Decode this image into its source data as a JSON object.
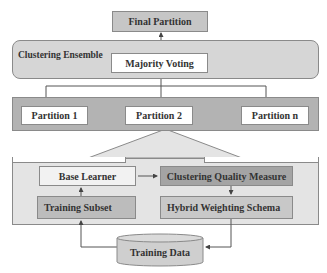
{
  "diagram": {
    "final_partition": "Final Partition",
    "ensemble": {
      "label": "Clustering Ensemble",
      "majority_voting": "Majority Voting"
    },
    "partitions": [
      "Partition 1",
      "Partition 2",
      "Partition n"
    ],
    "learning": {
      "base_learner": "Base Learner",
      "training_subset": "Training Subset",
      "quality_measure": "Clustering Quality Measure",
      "weighting_schema": "Hybrid Weighting Schema"
    },
    "training_data": "Training Data",
    "colors": {
      "final_partition": "#c6c6c6",
      "ensemble_panel": "#d6d6d6",
      "partitions_band": "#b3b3b3",
      "learning_panel": "#e4e4e4",
      "base_learner": "#f2f2f2",
      "training_subset": "#bcbcbc",
      "quality_measure": "#a4a4a4",
      "weighting_schema": "#c8c8c8",
      "training_data": "#cfcfcf"
    }
  }
}
